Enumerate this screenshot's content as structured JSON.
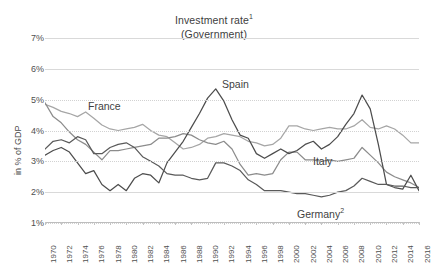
{
  "chart_data": {
    "type": "line",
    "title": "Investment rate",
    "title_superscript": "1",
    "subtitle": "(Government)",
    "xlabel": "",
    "ylabel": "in % of GDP",
    "ylim": [
      1,
      7
    ],
    "yticks": [
      "1%",
      "2%",
      "3%",
      "4%",
      "5%",
      "6%",
      "7%"
    ],
    "ytick_values": [
      1,
      2,
      3,
      4,
      5,
      6,
      7
    ],
    "xlim": [
      1970,
      2016
    ],
    "grid": true,
    "legend_position": "inline-annotations",
    "categories": [
      1970,
      1971,
      1972,
      1973,
      1974,
      1975,
      1976,
      1977,
      1978,
      1979,
      1980,
      1981,
      1982,
      1983,
      1984,
      1985,
      1986,
      1987,
      1988,
      1989,
      1990,
      1991,
      1992,
      1993,
      1994,
      1995,
      1996,
      1997,
      1998,
      1999,
      2000,
      2001,
      2002,
      2003,
      2004,
      2005,
      2006,
      2007,
      2008,
      2009,
      2010,
      2011,
      2012,
      2013,
      2014,
      2015,
      2016
    ],
    "xticks": [
      "1970",
      "1972",
      "1974",
      "1976",
      "1978",
      "1980",
      "1982",
      "1984",
      "1986",
      "1988",
      "1990",
      "1992",
      "1994",
      "1996",
      "1998",
      "2000",
      "2002",
      "2004",
      "2006",
      "2008",
      "2010",
      "2012",
      "2014",
      "2016"
    ],
    "series": [
      {
        "name": "France",
        "label": "France",
        "color": "#a6a6a6",
        "label_x": 88,
        "label_y": 100,
        "values": [
          4.85,
          4.75,
          4.62,
          4.55,
          4.45,
          4.6,
          4.4,
          4.18,
          4.05,
          4.0,
          4.05,
          4.1,
          4.2,
          4.0,
          3.85,
          3.8,
          3.6,
          3.4,
          3.45,
          3.55,
          3.75,
          3.8,
          3.9,
          3.85,
          3.8,
          3.65,
          3.6,
          3.5,
          3.55,
          3.75,
          4.15,
          4.15,
          4.05,
          4.0,
          4.05,
          4.1,
          4.05,
          4.05,
          4.15,
          4.35,
          4.1,
          4.05,
          4.15,
          4.05,
          3.85,
          3.6,
          3.6
        ]
      },
      {
        "name": "Italy",
        "label": "Italy",
        "color": "#8c8c8c",
        "label_x": 313,
        "label_y": 155,
        "values": [
          4.9,
          4.45,
          4.25,
          3.95,
          3.7,
          3.55,
          3.3,
          3.05,
          3.35,
          3.35,
          3.4,
          3.45,
          3.5,
          3.55,
          3.75,
          3.75,
          3.8,
          3.9,
          3.85,
          3.7,
          3.6,
          3.55,
          3.65,
          3.4,
          2.9,
          2.55,
          2.6,
          2.55,
          2.6,
          3.05,
          3.3,
          3.3,
          3.05,
          3.05,
          3.0,
          3.05,
          3.0,
          3.05,
          3.1,
          3.45,
          3.2,
          2.95,
          2.65,
          2.5,
          2.4,
          2.3,
          2.15
        ]
      },
      {
        "name": "Spain",
        "label": "Spain",
        "color": "#4d4d4d",
        "label_x": 222,
        "label_y": 78,
        "values": [
          3.2,
          3.35,
          3.45,
          3.3,
          2.95,
          2.6,
          2.7,
          2.25,
          2.05,
          2.25,
          2.05,
          2.45,
          2.6,
          2.55,
          2.3,
          2.95,
          3.3,
          3.65,
          4.1,
          4.55,
          5.05,
          5.35,
          4.95,
          4.35,
          3.85,
          3.75,
          3.25,
          3.1,
          3.25,
          3.4,
          3.25,
          3.35,
          3.55,
          3.65,
          3.4,
          3.55,
          3.8,
          4.2,
          4.55,
          5.15,
          4.7,
          3.55,
          2.25,
          2.15,
          2.1,
          2.55,
          2.05
        ]
      },
      {
        "name": "Germany",
        "label": "Germany",
        "label_superscript": "2",
        "color": "#5a5a5a",
        "label_x": 297,
        "label_y": 207,
        "values": [
          3.4,
          3.65,
          3.7,
          3.6,
          3.8,
          3.7,
          3.25,
          3.25,
          3.45,
          3.55,
          3.6,
          3.45,
          3.15,
          3.0,
          2.85,
          2.6,
          2.55,
          2.55,
          2.45,
          2.4,
          2.45,
          2.95,
          2.95,
          2.85,
          2.7,
          2.4,
          2.25,
          2.05,
          2.05,
          2.05,
          2.0,
          1.95,
          1.95,
          1.9,
          1.85,
          1.9,
          2.0,
          2.05,
          2.2,
          2.45,
          2.35,
          2.25,
          2.25,
          2.2,
          2.2,
          2.15,
          2.15
        ]
      }
    ]
  }
}
